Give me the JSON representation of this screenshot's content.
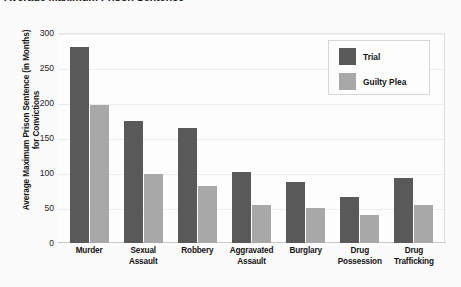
{
  "chart_data": {
    "type": "bar",
    "title": "Average Maximum Prison Sentence",
    "categories": [
      "Murder",
      "Sexual Assault",
      "Robbery",
      "Aggravated Assault",
      "Burglary",
      "Drug Possession",
      "Drug Trafficking"
    ],
    "category_lines": [
      [
        "Murder",
        ""
      ],
      [
        "Sexual",
        "Assault"
      ],
      [
        "Robbery",
        ""
      ],
      [
        "Aggravated",
        "Assault"
      ],
      [
        "Burglary",
        ""
      ],
      [
        "Drug",
        "Possession"
      ],
      [
        "Drug",
        "Trafficking"
      ]
    ],
    "series": [
      {
        "name": "Trial",
        "color": "#595959",
        "values": [
          280,
          175,
          165,
          102,
          87,
          66,
          93
        ]
      },
      {
        "name": "Guilty Plea",
        "color": "#a8a8a8",
        "values": [
          197,
          98,
          82,
          54,
          50,
          40,
          54
        ]
      }
    ],
    "xlabel": "",
    "ylabel": "Average Maximum Prison Sentence (in Months) for Convictions",
    "ylabel_lines": [
      "Average Maximum Prison Sentence (in Months)",
      "for Convictions"
    ],
    "ylim": [
      0,
      300
    ],
    "yticks": [
      300,
      250,
      200,
      150,
      100,
      50,
      0
    ],
    "grid": true,
    "legend_position": "top-right"
  },
  "legend": {
    "items": [
      {
        "label": "Trial",
        "color": "#595959"
      },
      {
        "label": "Guilty Plea",
        "color": "#a8a8a8"
      }
    ]
  }
}
